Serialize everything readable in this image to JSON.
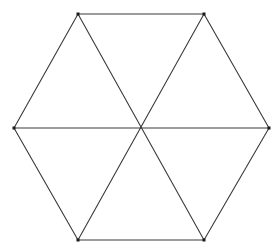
{
  "figure": {
    "background_color": "#ffffff",
    "line_color": "#3a3a3a",
    "vertex_color": "#1a1a1a",
    "line_width": 1.1,
    "vertex_marker_size": 3,
    "canvas": {
      "width": 280,
      "height": 252
    },
    "center": {
      "x": 141,
      "y": 128,
      "label": "center"
    },
    "vertices": [
      {
        "name": "top-left",
        "x": 78,
        "y": 14
      },
      {
        "name": "top-right",
        "x": 204,
        "y": 14
      },
      {
        "name": "right",
        "x": 269,
        "y": 128
      },
      {
        "name": "bottom-right",
        "x": 204,
        "y": 240
      },
      {
        "name": "bottom-left",
        "x": 78,
        "y": 240
      },
      {
        "name": "left",
        "x": 14,
        "y": 128
      }
    ],
    "edges": [
      {
        "name": "edge-top",
        "from": "top-left",
        "to": "top-right"
      },
      {
        "name": "edge-upper-right",
        "from": "top-right",
        "to": "right"
      },
      {
        "name": "edge-lower-right",
        "from": "right",
        "to": "bottom-right"
      },
      {
        "name": "edge-bottom",
        "from": "bottom-right",
        "to": "bottom-left"
      },
      {
        "name": "edge-lower-left",
        "from": "bottom-left",
        "to": "left"
      },
      {
        "name": "edge-upper-left",
        "from": "left",
        "to": "top-left"
      }
    ],
    "diagonals": [
      {
        "name": "diagonal-horizontal",
        "from": "left",
        "to": "right"
      },
      {
        "name": "diagonal-top-left",
        "from": "top-left",
        "to": "bottom-right"
      },
      {
        "name": "diagonal-top-right",
        "from": "top-right",
        "to": "bottom-left"
      }
    ],
    "triangle_count": 6
  }
}
